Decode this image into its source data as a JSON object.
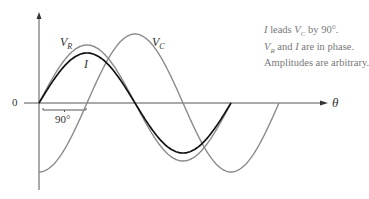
{
  "diagram": {
    "title": "",
    "axes": {
      "x_label": "θ",
      "origin_label": "0",
      "phase_marker_label": "90°"
    },
    "curves": [
      {
        "name": "V_R",
        "label_main": "V",
        "label_sub": "R",
        "color": "#8a8a8a",
        "relative_amplitude": 58,
        "phase_deg": 0
      },
      {
        "name": "I",
        "label_main": "I",
        "label_sub": "",
        "color": "#111111",
        "relative_amplitude": 50,
        "phase_deg": 0
      },
      {
        "name": "V_C",
        "label_main": "V",
        "label_sub": "C",
        "color": "#8a8a8a",
        "relative_amplitude": 69,
        "phase_deg": -90
      }
    ],
    "notes": [
      {
        "parts": [
          "I",
          " leads ",
          "V",
          "C",
          " by 90°."
        ]
      },
      {
        "parts": [
          "V",
          "R",
          " and ",
          "I",
          " are in phase."
        ]
      },
      {
        "parts": [
          "Amplitudes are arbitrary."
        ]
      }
    ]
  }
}
